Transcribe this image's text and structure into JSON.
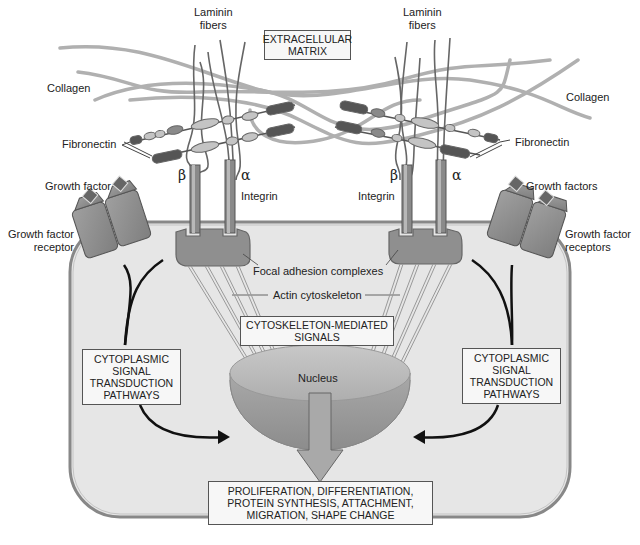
{
  "figure": {
    "title_box": [
      "EXTRACELLULAR",
      "MATRIX"
    ],
    "labels": {
      "laminin_left": [
        "Laminin",
        "fibers"
      ],
      "laminin_right": [
        "Laminin",
        "fibers"
      ],
      "collagen_left": "Collagen",
      "collagen_right": "Collagen",
      "fibronectin_left": "Fibronectin",
      "fibronectin_right": "Fibronectin",
      "growth_factor_left": "Growth factor",
      "growth_factor_right": "Growth factors",
      "gf_receptor_left": [
        "Growth factor",
        "receptor"
      ],
      "gf_receptor_right": [
        "Growth factor",
        "receptors"
      ],
      "beta_left": "β",
      "alpha_left": "α",
      "beta_right": "β",
      "alpha_right": "α",
      "integrin_left": "Integrin",
      "integrin_right": "Integrin",
      "focal_adhesion": "Focal adhesion complexes",
      "actin": "Actin cytoskeleton",
      "nucleus": "Nucleus"
    },
    "boxes": {
      "cytoskeleton_signals": [
        "CYTOSKELETON-MEDIATED",
        "SIGNALS"
      ],
      "cyto_left": [
        "CYTOPLASMIC",
        "SIGNAL",
        "TRANSDUCTION",
        "PATHWAYS"
      ],
      "cyto_right": [
        "CYTOPLASMIC",
        "SIGNAL",
        "TRANSDUCTION",
        "PATHWAYS"
      ],
      "outcome": [
        "PROLIFERATION, DIFFERENTIATION,",
        "PROTEIN SYNTHESIS, ATTACHMENT,",
        "MIGRATION, SHAPE CHANGE"
      ]
    },
    "colors": {
      "cell_fill": "#e6e6e6",
      "cell_border": "#8a8a8a",
      "protein_fill": "#8f8f8f",
      "nucleus_top": "#b9b9b9",
      "nucleus_side": "#9c9c9c",
      "box_bg": "#f7f7f7"
    }
  }
}
